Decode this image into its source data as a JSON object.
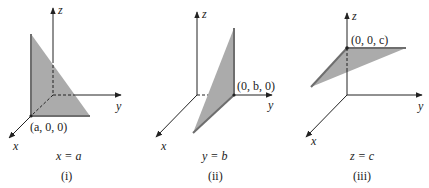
{
  "colors": {
    "plane_fill": "#ababab",
    "plane_edge": "#6e6e6e",
    "axis": "#222222",
    "background": "#ffffff"
  },
  "panels": [
    {
      "id": "i",
      "axis_labels": {
        "x": "x",
        "y": "y",
        "z": "z"
      },
      "point_label": "(a, 0, 0)",
      "equation": "x = a",
      "caption": "(i)"
    },
    {
      "id": "ii",
      "axis_labels": {
        "x": "x",
        "y": "y",
        "z": "z"
      },
      "point_label": "(0, b, 0)",
      "equation": "y = b",
      "caption": "(ii)"
    },
    {
      "id": "iii",
      "axis_labels": {
        "x": "x",
        "y": "y",
        "z": "z"
      },
      "point_label": "(0, 0, c)",
      "equation": "z = c",
      "caption": "(iii)"
    }
  ]
}
